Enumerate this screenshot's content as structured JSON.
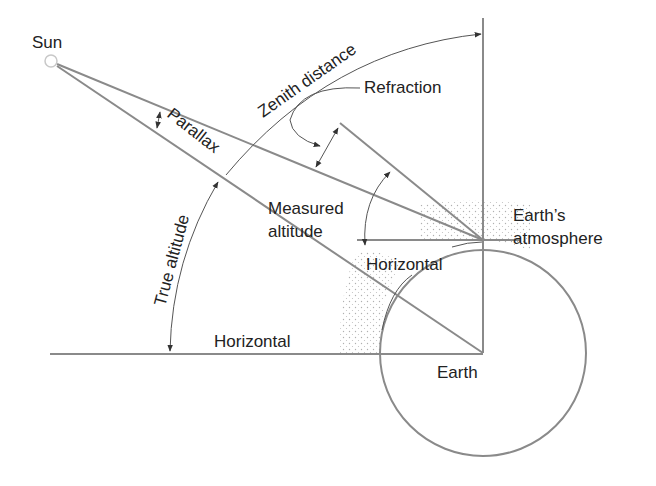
{
  "labels": {
    "sun": "Sun",
    "zenith_distance": "Zenith distance",
    "refraction": "Refraction",
    "parallax": "Parallax",
    "true_altitude": "True altitude",
    "measured_altitude_line1": "Measured",
    "measured_altitude_line2": "altitude",
    "horizontal_upper": "Horizontal",
    "horizontal_lower": "Horizontal",
    "earth_atmosphere_line1": "Earth’s",
    "earth_atmosphere_line2": "atmosphere",
    "earth": "Earth"
  },
  "colors": {
    "line": "#8a8a8a",
    "arrow": "#555555",
    "text": "#222222",
    "atmosphere_dots": "#b0b0b0"
  }
}
